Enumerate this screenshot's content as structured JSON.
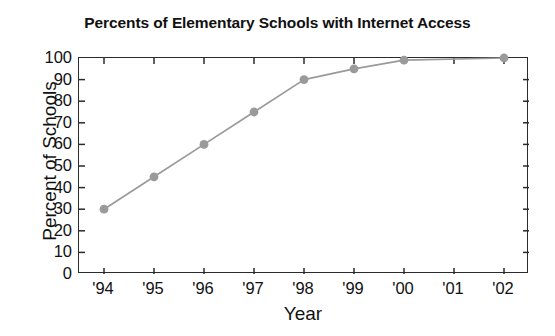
{
  "chart_data": {
    "type": "line",
    "title": "Percents of Elementary Schools with Internet Access",
    "xlabel": "Year",
    "ylabel": "Percent of Schools",
    "categories": [
      "'94",
      "'95",
      "'96",
      "'97",
      "'98",
      "'99",
      "'00",
      "'01",
      "'02"
    ],
    "x_values": [
      1994,
      1995,
      1996,
      1997,
      1998,
      1999,
      2000,
      2001,
      2002
    ],
    "values": [
      30,
      45,
      60,
      75,
      90,
      95,
      99,
      null,
      100
    ],
    "series": [
      {
        "name": "Percent of elementary schools with Internet access",
        "values": [
          30,
          45,
          60,
          75,
          90,
          95,
          99,
          null,
          100
        ],
        "marker": "circle",
        "color": "#9a9a9a"
      }
    ],
    "markers_shown_at": [
      "'94",
      "'95",
      "'96",
      "'97",
      "'98",
      "'99",
      "'00",
      "'02"
    ],
    "ylim": [
      0,
      100
    ],
    "ytick_values": [
      0,
      10,
      20,
      30,
      40,
      50,
      60,
      70,
      80,
      90,
      100
    ],
    "ytick_labels": [
      "0",
      "10",
      "20",
      "30",
      "40",
      "50",
      "60",
      "70",
      "80",
      "90",
      "100"
    ],
    "xtick_labels": [
      "'94",
      "'95",
      "'96",
      "'97",
      "'98",
      "'99",
      "'00",
      "'01",
      "'02"
    ],
    "grid": false,
    "legend": "none",
    "frame": "box",
    "tick_direction": "in",
    "line_color": "#9a9a9a",
    "marker_color": "#9a9a9a",
    "axis_color": "#2b2b2b",
    "background_color": "#ffffff"
  }
}
